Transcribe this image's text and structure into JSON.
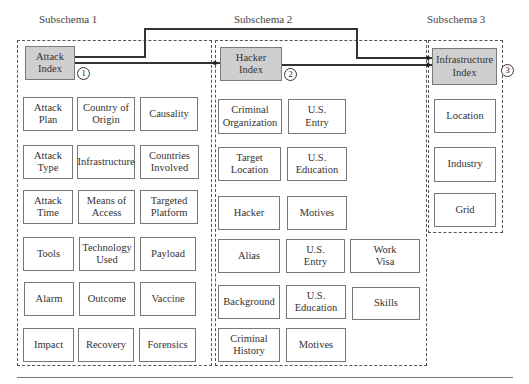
{
  "diagram": {
    "subschemas": [
      {
        "title": "Subschema 1",
        "index": {
          "label": "Attack\nIndex",
          "number": "1"
        },
        "entities": [
          [
            "Attack\nPlan",
            "Country of\nOrigin",
            "Causality"
          ],
          [
            "Attack\nType",
            "Infrastructure",
            "Countries\nInvolved"
          ],
          [
            "Attack\nTime",
            "Means of\nAccess",
            "Targeted\nPlatform"
          ],
          [
            "Tools",
            "Technology\nUsed",
            "Payload"
          ],
          [
            "Alarm",
            "Outcome",
            "Vaccine"
          ],
          [
            "Impact",
            "Recovery",
            "Forensics"
          ]
        ]
      },
      {
        "title": "Subschema 2",
        "index": {
          "label": "Hacker\nIndex",
          "number": "2"
        },
        "entities": [
          [
            "Criminal\nOrganization",
            "U.S.\nEntry"
          ],
          [
            "Target\nLocation",
            "U.S.\nEducation"
          ],
          [
            "Hacker",
            "Motives"
          ],
          [
            "Alias",
            "U.S.\nEntry",
            "Work\nVisa"
          ],
          [
            "Background",
            "U.S.\nEducation",
            "Skills"
          ],
          [
            "Criminal\nHistory",
            "Motives"
          ]
        ]
      },
      {
        "title": "Subschema 3",
        "index": {
          "label": "Infrastructure\nIndex",
          "number": "3"
        },
        "entities": [
          [
            "Location"
          ],
          [
            "Industry"
          ],
          [
            "Grid"
          ]
        ]
      }
    ],
    "connections": [
      {
        "from": "Attack Index",
        "to": "Hacker Index"
      },
      {
        "from": "Attack Index",
        "to": "Infrastructure Index"
      },
      {
        "from": "Hacker Index",
        "to": "Infrastructure Index"
      }
    ],
    "colors": {
      "index_fill": "#cfcfcf",
      "entity_fill": "#ffffff",
      "border": "#777777",
      "line": "#333333"
    }
  }
}
